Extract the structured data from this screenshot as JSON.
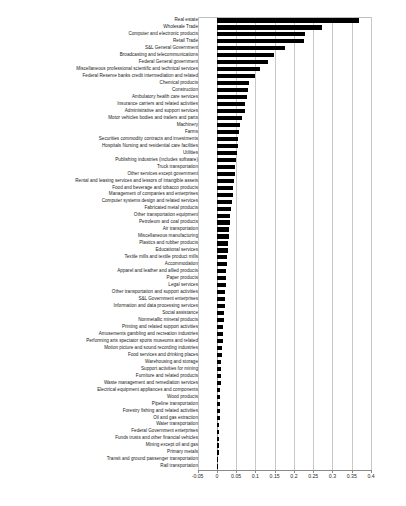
{
  "chart_data": {
    "type": "bar",
    "orientation": "horizontal",
    "title": "",
    "xlabel": "",
    "ylabel": "",
    "xlim": [
      -0.05,
      0.4
    ],
    "xticks": [
      -0.05,
      0,
      0.05,
      0.1,
      0.15,
      0.2,
      0.25,
      0.3,
      0.35,
      0.4
    ],
    "xtick_labels": [
      "-0.05",
      "0",
      "0.05",
      "0.1",
      "0.15",
      "0.2",
      "0.25",
      "0.3",
      "0.35",
      "0.4"
    ],
    "grid": true,
    "grid_axis": "x",
    "legend": false,
    "bar_color": "#000000",
    "categories": [
      "Real estate",
      "Wholesale Trade",
      "Computer and electronic products",
      "Retail Trade",
      "S&L General Government",
      "Broadcasting and telecommunications",
      "Federal General government",
      "Miscellaneous professional scientific and technical services",
      "Federal Reserve banks credit intermediation and related",
      "Chemical products",
      "Construction",
      "Ambulatory health care services",
      "Insurance carriers and related activities",
      "Administrative and support services",
      "Motor vehicles bodies and trailers and parts",
      "Machinery",
      "Farms",
      "Securities  commodity contracts  and investments",
      "Hospitals Nursing and residential care facilities",
      "Utilities",
      "Publishing industries (includes software)",
      "Truck transportation",
      "Other services except government",
      "Rental and leasing services and lessors of intangible assets",
      "Food and beverage and tobacco products",
      "Management of companies and enterprises",
      "Computer systems design and related services",
      "Fabricated metal products",
      "Other transportation equipment",
      "Petroleum and coal products",
      "Air transportation",
      "Miscellaneous manufacturing",
      "Plastics and rubber products",
      "Educational services",
      "Textile mills and textile product mills",
      "Accommodation",
      "Apparel and leather and allied products",
      "Paper products",
      "Legal services",
      "Other transportation and support activities",
      "S&L Government enterprises",
      "Information and data processing services",
      "Social assistance",
      "Nonmetallic mineral products",
      "Printing and related support activities",
      "Amusements gambling and recreation industries",
      "Performing arts spectator sports museums and related",
      "Motion picture and sound recording industries",
      "Food services and drinking places",
      "Warehousing and storage",
      "Support activities for mining",
      "Furniture and related products",
      "Waste management and remediation services",
      "Electrical equipment appliances and components",
      "Wood products",
      "Pipeline transportation",
      "Forestry  fishing  and related activities",
      "Oil and gas extraction",
      "Water transportation",
      "Federal Government enterprises",
      "Funds  trusts  and other financial vehicles",
      "Mining  except oil and gas",
      "Primary metals",
      "Transit and ground passenger transportation",
      "Rail transportation"
    ],
    "values": [
      0.37,
      0.272,
      0.228,
      0.226,
      0.177,
      0.148,
      0.134,
      0.112,
      0.098,
      0.083,
      0.081,
      0.077,
      0.074,
      0.072,
      0.066,
      0.06,
      0.058,
      0.056,
      0.054,
      0.052,
      0.05,
      0.048,
      0.046,
      0.044,
      0.043,
      0.041,
      0.039,
      0.037,
      0.035,
      0.034,
      0.032,
      0.031,
      0.029,
      0.028,
      0.027,
      0.026,
      0.025,
      0.024,
      0.023,
      0.022,
      0.021,
      0.02,
      0.019,
      0.018,
      0.017,
      0.016,
      0.015,
      0.014,
      0.013,
      0.012,
      0.011,
      0.01,
      0.0095,
      0.009,
      0.0085,
      0.008,
      0.0075,
      0.007,
      0.0065,
      0.006,
      0.0055,
      0.005,
      0.0045,
      0.004,
      0.003
    ]
  }
}
